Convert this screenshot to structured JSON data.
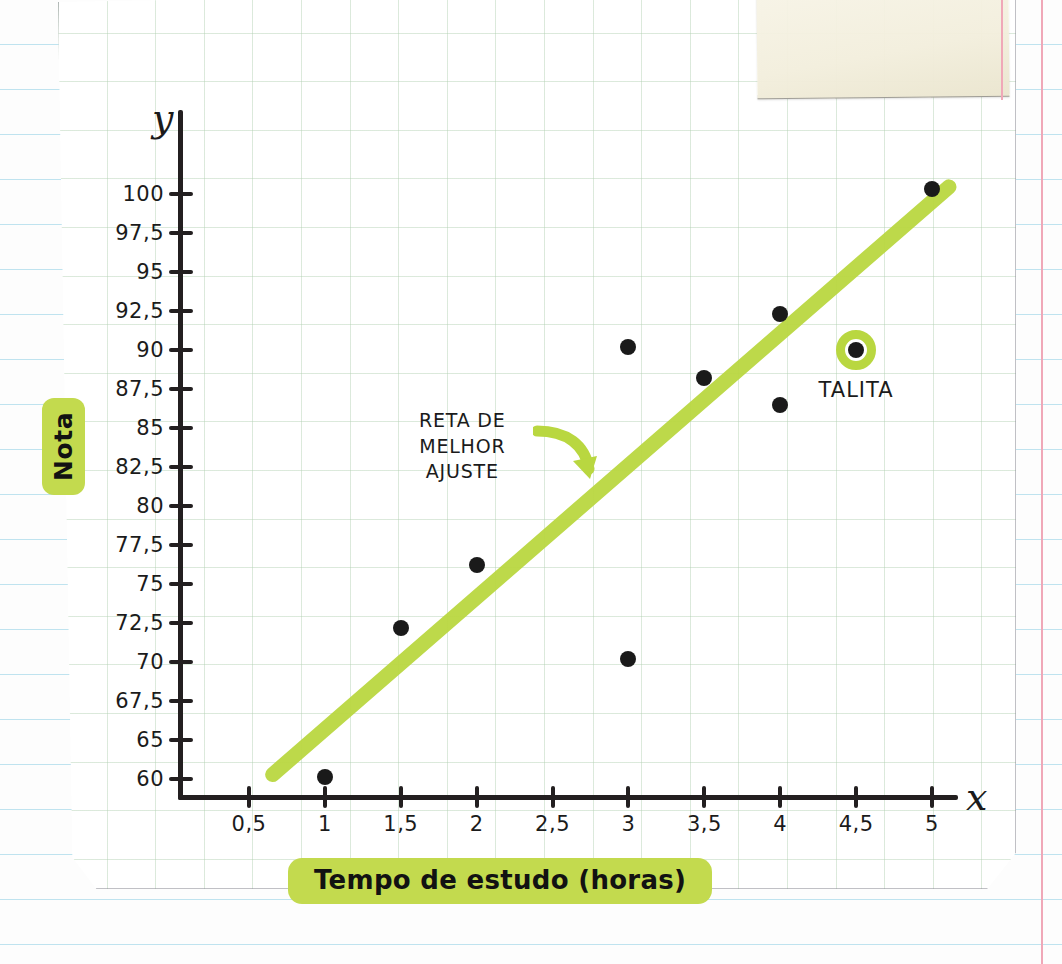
{
  "chart_data": {
    "type": "scatter",
    "title": "",
    "xlabel": "Tempo de estudo (horas)",
    "ylabel": "Nota",
    "x_axis_symbol": "x",
    "y_axis_symbol": "y",
    "xlim": [
      0,
      5.4
    ],
    "ylim": [
      57.5,
      102.5
    ],
    "grid": true,
    "legend": "none",
    "x_ticks": [
      "0,5",
      "1",
      "1,5",
      "2",
      "2,5",
      "3",
      "3,5",
      "4",
      "4,5",
      "5"
    ],
    "x_tick_values": [
      0.5,
      1,
      1.5,
      2,
      2.5,
      3,
      3.5,
      4,
      4.5,
      5
    ],
    "y_ticks": [
      "100",
      "97,5",
      "95",
      "92,5",
      "90",
      "87,5",
      "85",
      "82,5",
      "80",
      "77,5",
      "75",
      "72,5",
      "70",
      "67,5",
      "65",
      "60"
    ],
    "y_tick_values": [
      100,
      97.5,
      95,
      92.5,
      90,
      87.5,
      85,
      82.5,
      80,
      77.5,
      75,
      72.5,
      70,
      67.5,
      65,
      60
    ],
    "points": [
      {
        "x": 1,
        "y": 60.3,
        "label": "",
        "highlighted": false
      },
      {
        "x": 1.5,
        "y": 72.2,
        "label": "",
        "highlighted": false
      },
      {
        "x": 2,
        "y": 76.2,
        "label": "",
        "highlighted": false
      },
      {
        "x": 3,
        "y": 90.2,
        "label": "",
        "highlighted": false
      },
      {
        "x": 3,
        "y": 70.2,
        "label": "",
        "highlighted": false
      },
      {
        "x": 3.5,
        "y": 88.2,
        "label": "",
        "highlighted": false
      },
      {
        "x": 4,
        "y": 92.3,
        "label": "",
        "highlighted": false
      },
      {
        "x": 4,
        "y": 86.5,
        "label": "",
        "highlighted": false
      },
      {
        "x": 4.5,
        "y": 90.0,
        "label": "TALITA",
        "highlighted": true
      },
      {
        "x": 5,
        "y": 100.3,
        "label": "",
        "highlighted": false
      }
    ],
    "trendline": {
      "label": "RETA DE MELHOR AJUSTE",
      "color": "#b9d740",
      "x_start": 0.62,
      "y_start": 59.5,
      "x_end": 5.15,
      "y_end": 100.8
    },
    "annotation": {
      "line1": "RETA DE",
      "line2": "MELHOR",
      "line3": "AJUSTE",
      "arrow": "curved-arrow-icon"
    },
    "colors": {
      "highlighter": "#b9d740",
      "highlighter_box": "#c3da4e",
      "ink": "#1a1a1a",
      "grid": "#b0cfb0",
      "rule_line": "#bfe3ef",
      "margin_line": "#f0a8b8"
    }
  }
}
